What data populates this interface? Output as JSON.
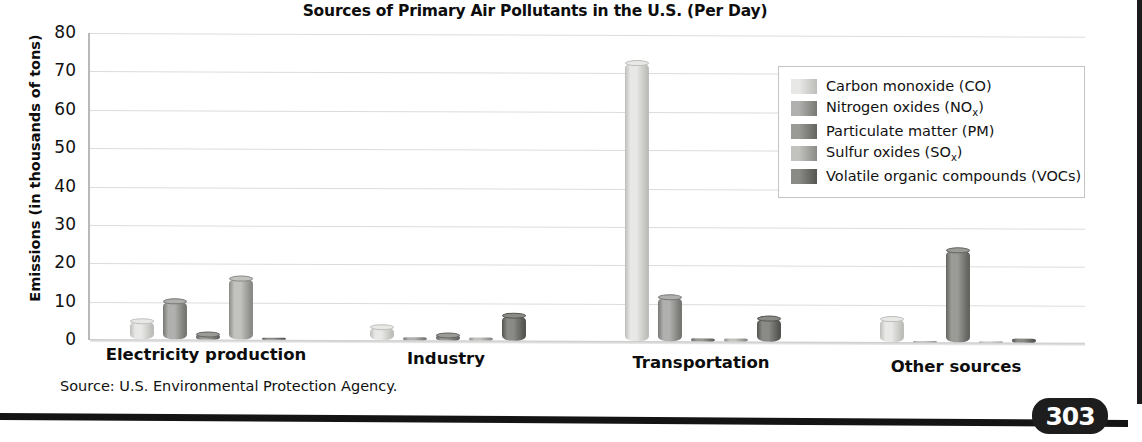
{
  "page": {
    "number": "303"
  },
  "chart_data": {
    "type": "bar",
    "title": "Sources of Primary Air Pollutants in the U.S. (Per Day)",
    "xlabel": "",
    "ylabel": "Emissions (in thousands of tons)",
    "ylim": [
      0,
      80
    ],
    "yticks": [
      80,
      70,
      60,
      50,
      40,
      30,
      20,
      10,
      0
    ],
    "grid": true,
    "legend_position": "top-right",
    "categories": [
      "Electricity production",
      "Industry",
      "Transportation",
      "Other sources"
    ],
    "series": [
      {
        "name": "Carbon monoxide (CO)",
        "key": "co",
        "color": "#e8e8e6",
        "color_dark": "#bdbdba",
        "values": [
          4.8,
          3.5,
          72.5,
          6.0
        ]
      },
      {
        "name": "Nitrogen oxides (NOx)",
        "key": "nox",
        "color": "#b0b0ae",
        "color_dark": "#777774",
        "values": [
          9.8,
          0.8,
          11.5,
          0.3
        ]
      },
      {
        "name": "Particulate matter (PM)",
        "key": "pm",
        "color": "#9a9a97",
        "color_dark": "#636360",
        "values": [
          1.2,
          1.2,
          0.8,
          24.0
        ]
      },
      {
        "name": "Sulfur oxides (SOx)",
        "key": "sox",
        "color": "#c2c2bf",
        "color_dark": "#8a8a87",
        "values": [
          15.8,
          0.8,
          0.9,
          0.1
        ]
      },
      {
        "name": "Volatile organic compounds (VOCs)",
        "key": "vocs",
        "color": "#8a8a87",
        "color_dark": "#545451",
        "values": [
          0.4,
          6.5,
          6.0,
          1.0
        ]
      }
    ],
    "legend": [
      {
        "label_main": "Carbon monoxide (CO)",
        "label_pre": "Carbon monoxide (CO)",
        "sub": "",
        "post": ""
      },
      {
        "label_main": "Nitrogen oxides (NOx)",
        "label_pre": "Nitrogen oxides (NO",
        "sub": "x",
        "post": ")"
      },
      {
        "label_main": "Particulate matter (PM)",
        "label_pre": "Particulate matter (PM)",
        "sub": "",
        "post": ""
      },
      {
        "label_main": "Sulfur oxides (SOx)",
        "label_pre": "Sulfur oxides (SO",
        "sub": "x",
        "post": ")"
      },
      {
        "label_main": "Volatile organic compounds (VOCs)",
        "label_pre": "Volatile organic compounds (VOCs)",
        "sub": "",
        "post": ""
      }
    ],
    "source_note": "Source: U.S. Environmental Protection Agency."
  }
}
